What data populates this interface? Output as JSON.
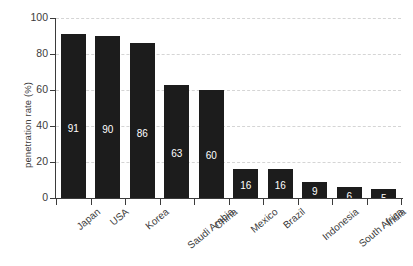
{
  "chart_data": {
    "type": "bar",
    "title": "",
    "xlabel": "",
    "ylabel": "penetration rate (%)",
    "ylim": [
      0,
      100
    ],
    "yticks": [
      0,
      20,
      40,
      60,
      80,
      100
    ],
    "grid": true,
    "legend": "none",
    "bar_color": "#1c1c1c",
    "value_label_color": "#ffffff",
    "gridline_color": "#d5d5d5",
    "axis_color": "#3b3b3b",
    "categories": [
      "Japan",
      "USA",
      "Korea",
      "Saudi Arabia",
      "China",
      "Mexico",
      "Brazil",
      "Indonesia",
      "South Africa",
      "India"
    ],
    "values": [
      91,
      90,
      86,
      63,
      60,
      16,
      16,
      9,
      6,
      5
    ],
    "value_labels": [
      "91",
      "90",
      "86",
      "63",
      "60",
      "16",
      "16",
      "9",
      "6",
      "5"
    ]
  },
  "axis": {
    "y_tick_labels": [
      "100",
      "80",
      "60",
      "40",
      "20",
      "0"
    ]
  }
}
